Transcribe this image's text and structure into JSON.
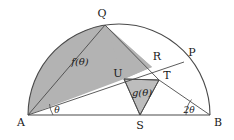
{
  "figure": {
    "kind": "geometry-diagram",
    "canvas": {
      "width": 234,
      "height": 140
    },
    "colors": {
      "background": "#ffffff",
      "stroke": "#4a4a4a",
      "stroke_dark": "#3a3a3a",
      "fill_shaded": "#b3b3b3",
      "fill_shaded_light": "#bdbdbd",
      "text": "#1a1a1a"
    },
    "geometry": {
      "center": {
        "x": 119,
        "y": 115
      },
      "radius": 91,
      "baseline_y": 115
    },
    "points": {
      "A": {
        "x": 28,
        "y": 115,
        "label_x": 21,
        "label_y": 123
      },
      "B": {
        "x": 210,
        "y": 115,
        "label_x": 218,
        "label_y": 123
      },
      "Q": {
        "x": 105,
        "y": 25,
        "label_x": 102,
        "label_y": 14
      },
      "P": {
        "x": 184,
        "y": 62,
        "label_x": 192,
        "label_y": 53
      },
      "R": {
        "x": 152,
        "y": 67,
        "label_x": 157,
        "label_y": 57
      },
      "T": {
        "x": 159,
        "y": 80,
        "label_x": 167,
        "label_y": 76
      },
      "U": {
        "x": 124,
        "y": 79,
        "label_x": 118,
        "label_y": 74
      },
      "S": {
        "x": 140,
        "y": 115,
        "label_x": 140,
        "label_y": 126
      }
    },
    "labels": {
      "A": "A",
      "B": "B",
      "P": "P",
      "Q": "Q",
      "R": "R",
      "S": "S",
      "T": "T",
      "U": "U",
      "f_theta": "f(θ)",
      "g_theta": "g(θ)",
      "angle_theta": "θ",
      "angle_two_theta": "2θ"
    },
    "label_positions": {
      "f_theta": {
        "x": 80,
        "y": 62
      },
      "g_theta": {
        "x": 142,
        "y": 93
      },
      "angle_theta": {
        "x": 57,
        "y": 110
      },
      "angle_two_theta": {
        "x": 189,
        "y": 110
      }
    },
    "regions": [
      {
        "name": "f-theta-region",
        "label": "f(θ)",
        "shaded": true
      },
      {
        "name": "g-theta-region",
        "label": "g(θ)",
        "shaded": true
      },
      {
        "name": "upper-triangle-region",
        "label": "",
        "shaded": true
      }
    ],
    "segments": [
      {
        "name": "segment-AB",
        "from": "A",
        "to": "B"
      },
      {
        "name": "segment-AQ",
        "from": "A",
        "to": "Q"
      },
      {
        "name": "segment-AP",
        "from": "A",
        "to": "P"
      },
      {
        "name": "segment-QT",
        "from": "Q",
        "to": "T"
      },
      {
        "name": "segment-TB",
        "from": "T",
        "to": "B"
      },
      {
        "name": "segment-UT",
        "from": "U",
        "to": "T"
      },
      {
        "name": "segment-US",
        "from": "U",
        "to": "S"
      },
      {
        "name": "segment-TS",
        "from": "T",
        "to": "S"
      }
    ],
    "arcs": [
      {
        "name": "arc-AB-semicircle",
        "from": "A",
        "to": "B"
      }
    ]
  }
}
